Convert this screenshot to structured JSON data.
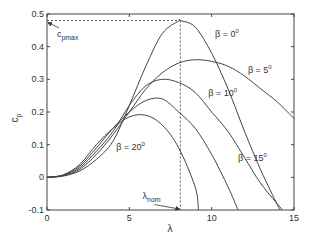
{
  "chart_data": {
    "type": "line",
    "title": "",
    "xlabel": "λ",
    "ylabel": "c_p",
    "xlim": [
      0,
      15
    ],
    "ylim": [
      -0.1,
      0.5
    ],
    "grid": false,
    "legend_position": "inline labels",
    "xticks": [
      0,
      5,
      10,
      15
    ],
    "xtick_labels": [
      "0",
      "5",
      "10",
      "15"
    ],
    "yticks": [
      -0.1,
      0,
      0.1,
      0.2,
      0.3,
      0.4,
      0.5
    ],
    "ytick_labels": [
      "-0.1",
      "0",
      "0.1",
      "0.2",
      "0.3",
      "0.4",
      "0.5"
    ],
    "series": [
      {
        "name": "β = 0°",
        "label_base": "β = 0",
        "label_sup": "0",
        "x": [
          0,
          1,
          2,
          3,
          4,
          5,
          6,
          7,
          8,
          8.1,
          9,
          10,
          11,
          12,
          13,
          14,
          14.15
        ],
        "y": [
          0,
          0.004,
          0.02,
          0.055,
          0.11,
          0.22,
          0.34,
          0.44,
          0.479,
          0.48,
          0.46,
          0.38,
          0.27,
          0.14,
          0.02,
          -0.085,
          -0.1
        ],
        "label_pos": [
          10.2,
          0.43
        ]
      },
      {
        "name": "β = 5°",
        "label_base": "β = 5",
        "label_sup": "0",
        "x": [
          0,
          1,
          2,
          3,
          4,
          5,
          6,
          7,
          8,
          9,
          10,
          11,
          12,
          13,
          14,
          15
        ],
        "y": [
          0,
          0.005,
          0.025,
          0.07,
          0.13,
          0.2,
          0.27,
          0.32,
          0.35,
          0.36,
          0.355,
          0.34,
          0.31,
          0.27,
          0.23,
          0.18
        ],
        "label_pos": [
          12.2,
          0.32
        ]
      },
      {
        "name": "β = 10°",
        "label_base": "β = 10",
        "label_sup": "0",
        "x": [
          0,
          1,
          2,
          3,
          4,
          5,
          6,
          7,
          8,
          9,
          10,
          11,
          12,
          13,
          14.3
        ],
        "y": [
          0,
          0.006,
          0.03,
          0.08,
          0.14,
          0.22,
          0.28,
          0.3,
          0.29,
          0.26,
          0.2,
          0.14,
          0.06,
          -0.02,
          -0.1
        ],
        "label_pos": [
          9.8,
          0.25
        ]
      },
      {
        "name": "β = 15°",
        "label_base": "β = 15",
        "label_sup": "0",
        "x": [
          0,
          1,
          2,
          3,
          4,
          5,
          6,
          7,
          8,
          9,
          10,
          11,
          11.6
        ],
        "y": [
          0,
          0.007,
          0.035,
          0.09,
          0.15,
          0.2,
          0.235,
          0.24,
          0.2,
          0.15,
          0.07,
          -0.03,
          -0.1
        ],
        "label_pos": [
          11.6,
          0.05
        ]
      },
      {
        "name": "β = 20°",
        "label_base": "β = 20",
        "label_sup": "0",
        "x": [
          0,
          1,
          2,
          3,
          4,
          5,
          6,
          7,
          8,
          9,
          9.2
        ],
        "y": [
          0,
          0.008,
          0.04,
          0.1,
          0.15,
          0.185,
          0.19,
          0.16,
          0.09,
          -0.03,
          -0.1
        ],
        "label_pos": [
          4.2,
          0.085
        ]
      }
    ],
    "annotations": [
      {
        "text": "c_pmax",
        "base": "c",
        "sub": "pmax",
        "arrow_to": [
          0,
          0.48
        ],
        "text_pos": [
          0.6,
          0.43
        ]
      },
      {
        "text": "λ_nom",
        "base": "λ",
        "sub": "nom",
        "arrow_to": [
          8.1,
          -0.1
        ],
        "text_pos": [
          5.8,
          -0.065
        ]
      },
      {
        "type": "dashed-line",
        "from": [
          0,
          0.48
        ],
        "to": [
          8.1,
          0.48
        ]
      },
      {
        "type": "dashed-line",
        "from": [
          8.1,
          0.48
        ],
        "to": [
          8.1,
          -0.1
        ]
      }
    ],
    "colors": {
      "curve": "#444444",
      "axis": "#444444",
      "dashed": "#333333"
    }
  }
}
